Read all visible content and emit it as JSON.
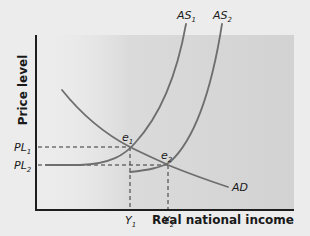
{
  "diagram": {
    "y_axis_label": "Price level",
    "x_axis_label": "Real national income",
    "curves": {
      "as1": {
        "label": "AS",
        "sub": "1"
      },
      "as2": {
        "label": "AS",
        "sub": "2"
      },
      "ad": {
        "label": "AD"
      }
    },
    "points": {
      "e1": {
        "label": "e",
        "sub": "1"
      },
      "e2": {
        "label": "e",
        "sub": "2"
      }
    },
    "y_ticks": [
      {
        "label": "PL",
        "sub": "1"
      },
      {
        "label": "PL",
        "sub": "2"
      }
    ],
    "x_ticks": [
      {
        "label": "Y",
        "sub": "1"
      },
      {
        "label": "Y",
        "sub": "2"
      }
    ],
    "colors": {
      "background": "#ececec",
      "shaded_region": "#d2d2d2",
      "curve": "#6e6e6e",
      "axis": "#1e1e1e",
      "text": "#1a1a1a"
    }
  }
}
